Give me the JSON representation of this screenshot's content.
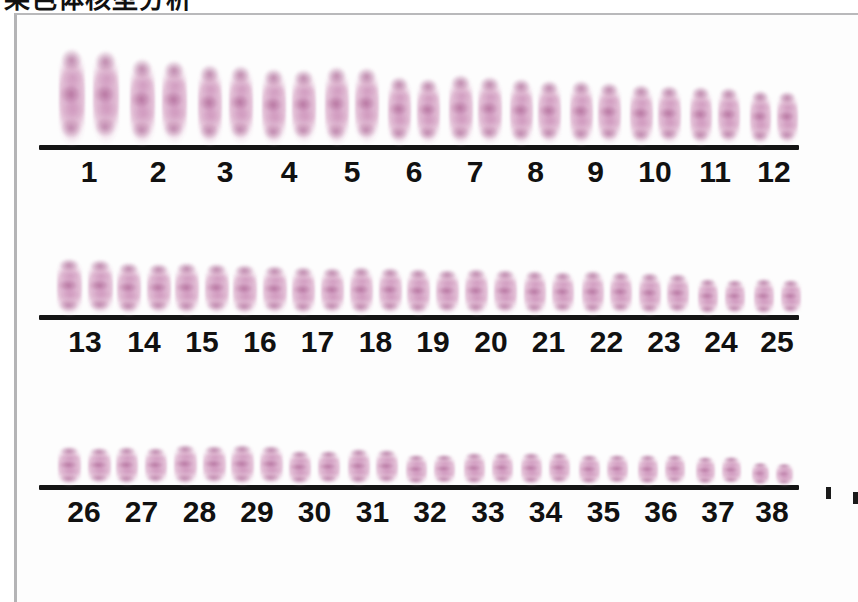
{
  "caption": {
    "text": "染色体核型分析",
    "note": "cropped-top-heading"
  },
  "figure": {
    "kind": "karyotype-plate",
    "organism_chromosome_pair_count": 38,
    "stain_color": "#c78cb7",
    "baseline_color": "#141414",
    "label_color": "#111111",
    "frame_color": "#b6b6b8",
    "background_color": "#fdfdfd"
  },
  "rows": [
    {
      "name": "row-1",
      "labels": [
        "1",
        "2",
        "3",
        "4",
        "5",
        "6",
        "7",
        "8",
        "9",
        "10",
        "11",
        "12"
      ],
      "baseline": {
        "left": 22,
        "width": 760
      },
      "label_font_size": 30,
      "pairs": [
        {
          "label": "1",
          "x": 40,
          "w": 64,
          "gap": 8,
          "chrom_w": 26,
          "h": 98
        },
        {
          "label": "2",
          "x": 110,
          "w": 62,
          "gap": 7,
          "chrom_w": 25,
          "h": 88
        },
        {
          "label": "3",
          "x": 178,
          "w": 60,
          "gap": 7,
          "chrom_w": 24,
          "h": 82
        },
        {
          "label": "4",
          "x": 243,
          "w": 58,
          "gap": 6,
          "chrom_w": 24,
          "h": 78
        },
        {
          "label": "5",
          "x": 306,
          "w": 58,
          "gap": 6,
          "chrom_w": 24,
          "h": 80
        },
        {
          "label": "6",
          "x": 369,
          "w": 56,
          "gap": 6,
          "chrom_w": 23,
          "h": 70
        },
        {
          "label": "7",
          "x": 430,
          "w": 56,
          "gap": 5,
          "chrom_w": 24,
          "h": 72
        },
        {
          "label": "8",
          "x": 491,
          "w": 55,
          "gap": 5,
          "chrom_w": 23,
          "h": 68
        },
        {
          "label": "9",
          "x": 551,
          "w": 55,
          "gap": 5,
          "chrom_w": 23,
          "h": 66
        },
        {
          "label": "10",
          "x": 611,
          "w": 54,
          "gap": 5,
          "chrom_w": 23,
          "h": 62
        },
        {
          "label": "11",
          "x": 671,
          "w": 54,
          "gap": 6,
          "chrom_w": 22,
          "h": 60
        },
        {
          "label": "12",
          "x": 731,
          "w": 52,
          "gap": 6,
          "chrom_w": 21,
          "h": 56
        }
      ]
    },
    {
      "name": "row-2",
      "labels": [
        "13",
        "14",
        "15",
        "16",
        "17",
        "18",
        "19",
        "20",
        "21",
        "22",
        "23",
        "24",
        "25"
      ],
      "baseline": {
        "left": 22,
        "width": 760
      },
      "label_font_size": 30,
      "pairs": [
        {
          "label": "13",
          "x": 38,
          "w": 60,
          "gap": 6,
          "chrom_w": 25,
          "h": 58
        },
        {
          "label": "14",
          "x": 98,
          "w": 58,
          "gap": 6,
          "chrom_w": 24,
          "h": 54
        },
        {
          "label": "15",
          "x": 156,
          "w": 58,
          "gap": 6,
          "chrom_w": 24,
          "h": 54
        },
        {
          "label": "16",
          "x": 214,
          "w": 58,
          "gap": 6,
          "chrom_w": 24,
          "h": 52
        },
        {
          "label": "17",
          "x": 272,
          "w": 57,
          "gap": 6,
          "chrom_w": 23,
          "h": 50
        },
        {
          "label": "18",
          "x": 330,
          "w": 57,
          "gap": 6,
          "chrom_w": 23,
          "h": 50
        },
        {
          "label": "19",
          "x": 388,
          "w": 56,
          "gap": 6,
          "chrom_w": 23,
          "h": 48
        },
        {
          "label": "20",
          "x": 446,
          "w": 56,
          "gap": 6,
          "chrom_w": 23,
          "h": 48
        },
        {
          "label": "21",
          "x": 504,
          "w": 55,
          "gap": 6,
          "chrom_w": 22,
          "h": 46
        },
        {
          "label": "22",
          "x": 562,
          "w": 55,
          "gap": 6,
          "chrom_w": 22,
          "h": 46
        },
        {
          "label": "23",
          "x": 620,
          "w": 54,
          "gap": 6,
          "chrom_w": 22,
          "h": 44
        },
        {
          "label": "24",
          "x": 678,
          "w": 52,
          "gap": 7,
          "chrom_w": 20,
          "h": 38
        },
        {
          "label": "25",
          "x": 734,
          "w": 52,
          "gap": 7,
          "chrom_w": 20,
          "h": 38
        }
      ]
    },
    {
      "name": "row-3",
      "labels": [
        "26",
        "27",
        "28",
        "29",
        "30",
        "31",
        "32",
        "33",
        "34",
        "35",
        "36",
        "37",
        "38"
      ],
      "baseline": {
        "left": 22,
        "width": 760
      },
      "label_font_size": 30,
      "pairs": [
        {
          "label": "26",
          "x": 38,
          "w": 58,
          "gap": 7,
          "chrom_w": 23,
          "h": 40
        },
        {
          "label": "27",
          "x": 96,
          "w": 57,
          "gap": 7,
          "chrom_w": 22,
          "h": 40
        },
        {
          "label": "28",
          "x": 154,
          "w": 57,
          "gap": 6,
          "chrom_w": 23,
          "h": 42
        },
        {
          "label": "29",
          "x": 212,
          "w": 56,
          "gap": 6,
          "chrom_w": 23,
          "h": 42
        },
        {
          "label": "30",
          "x": 270,
          "w": 55,
          "gap": 7,
          "chrom_w": 22,
          "h": 36
        },
        {
          "label": "31",
          "x": 328,
          "w": 55,
          "gap": 6,
          "chrom_w": 22,
          "h": 38
        },
        {
          "label": "32",
          "x": 386,
          "w": 54,
          "gap": 7,
          "chrom_w": 21,
          "h": 32
        },
        {
          "label": "33",
          "x": 444,
          "w": 54,
          "gap": 7,
          "chrom_w": 21,
          "h": 34
        },
        {
          "label": "34",
          "x": 502,
          "w": 53,
          "gap": 7,
          "chrom_w": 21,
          "h": 34
        },
        {
          "label": "35",
          "x": 560,
          "w": 53,
          "gap": 7,
          "chrom_w": 21,
          "h": 32
        },
        {
          "label": "36",
          "x": 618,
          "w": 52,
          "gap": 7,
          "chrom_w": 20,
          "h": 32
        },
        {
          "label": "37",
          "x": 676,
          "w": 50,
          "gap": 7,
          "chrom_w": 19,
          "h": 30
        },
        {
          "label": "38",
          "x": 732,
          "w": 46,
          "gap": 7,
          "chrom_w": 17,
          "h": 24
        }
      ]
    }
  ],
  "edge_marks": [
    {
      "name": "edge-speck-top",
      "x": 826,
      "y": 487
    },
    {
      "name": "edge-speck-bottom",
      "x": 853,
      "y": 492
    }
  ]
}
